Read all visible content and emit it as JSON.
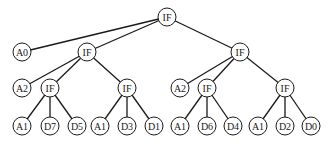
{
  "diagram": {
    "type": "tree",
    "node_radius": 9,
    "colors": {
      "stroke": "#1a1a1a",
      "fill": "#ffffff",
      "background": "#ffffff"
    },
    "nodes": [
      {
        "id": "n0",
        "label": "IF",
        "x": 167,
        "y": 17
      },
      {
        "id": "n1",
        "label": "A0",
        "x": 22,
        "y": 52
      },
      {
        "id": "n2",
        "label": "IF",
        "x": 87,
        "y": 52
      },
      {
        "id": "n3",
        "label": "IF",
        "x": 240,
        "y": 52
      },
      {
        "id": "n4",
        "label": "A2",
        "x": 22,
        "y": 88
      },
      {
        "id": "n5",
        "label": "IF",
        "x": 50,
        "y": 88
      },
      {
        "id": "n6",
        "label": "IF",
        "x": 127,
        "y": 88
      },
      {
        "id": "n7",
        "label": "A2",
        "x": 180,
        "y": 88
      },
      {
        "id": "n8",
        "label": "IF",
        "x": 207,
        "y": 88
      },
      {
        "id": "n9",
        "label": "IF",
        "x": 285,
        "y": 88
      },
      {
        "id": "n10",
        "label": "A1",
        "x": 22,
        "y": 126
      },
      {
        "id": "n11",
        "label": "D7",
        "x": 50,
        "y": 126
      },
      {
        "id": "n12",
        "label": "D5",
        "x": 77,
        "y": 126
      },
      {
        "id": "n13",
        "label": "A1",
        "x": 100,
        "y": 126
      },
      {
        "id": "n14",
        "label": "D3",
        "x": 127,
        "y": 126
      },
      {
        "id": "n15",
        "label": "D1",
        "x": 154,
        "y": 126
      },
      {
        "id": "n16",
        "label": "A1",
        "x": 180,
        "y": 126
      },
      {
        "id": "n17",
        "label": "D6",
        "x": 207,
        "y": 126
      },
      {
        "id": "n18",
        "label": "D4",
        "x": 233,
        "y": 126
      },
      {
        "id": "n19",
        "label": "A1",
        "x": 258,
        "y": 126
      },
      {
        "id": "n20",
        "label": "D2",
        "x": 285,
        "y": 126
      },
      {
        "id": "n21",
        "label": "D0",
        "x": 311,
        "y": 126
      }
    ],
    "edges": [
      [
        "n0",
        "n1"
      ],
      [
        "n0",
        "n2"
      ],
      [
        "n0",
        "n3"
      ],
      [
        "n2",
        "n4"
      ],
      [
        "n2",
        "n5"
      ],
      [
        "n2",
        "n6"
      ],
      [
        "n3",
        "n7"
      ],
      [
        "n3",
        "n8"
      ],
      [
        "n3",
        "n9"
      ],
      [
        "n5",
        "n10"
      ],
      [
        "n5",
        "n11"
      ],
      [
        "n5",
        "n12"
      ],
      [
        "n6",
        "n13"
      ],
      [
        "n6",
        "n14"
      ],
      [
        "n6",
        "n15"
      ],
      [
        "n8",
        "n16"
      ],
      [
        "n8",
        "n17"
      ],
      [
        "n8",
        "n18"
      ],
      [
        "n9",
        "n19"
      ],
      [
        "n9",
        "n20"
      ],
      [
        "n9",
        "n21"
      ]
    ]
  }
}
